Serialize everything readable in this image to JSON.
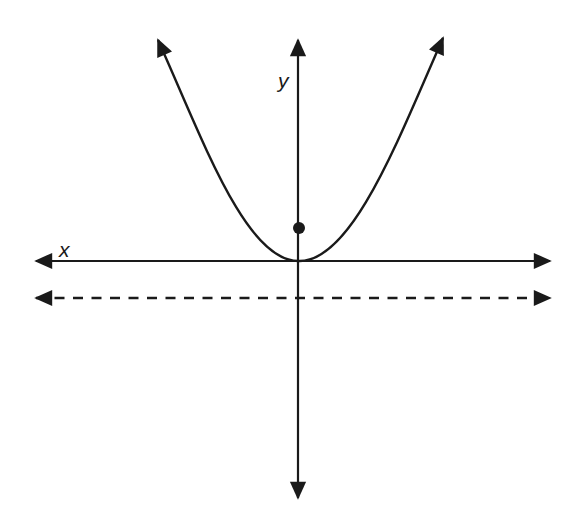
{
  "diagram": {
    "type": "parabola-with-focus-and-directrix",
    "labels": {
      "x_axis": "x",
      "y_axis": "y"
    },
    "elements": {
      "parabola": {
        "vertex": "origin",
        "opens": "up"
      },
      "focus": {
        "position": "on positive y-axis above vertex"
      },
      "directrix": {
        "style": "dashed",
        "position": "horizontal line below x-axis"
      }
    },
    "colors": {
      "stroke": "#1a1a1a",
      "background": "#ffffff"
    }
  }
}
